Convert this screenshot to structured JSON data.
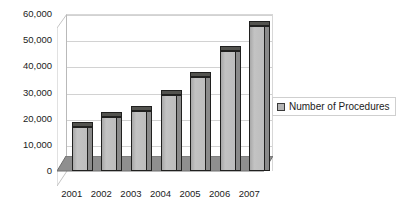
{
  "chart_data": {
    "type": "bar",
    "title": "",
    "xlabel": "",
    "ylabel": "",
    "categories": [
      "2001",
      "2002",
      "2003",
      "2004",
      "2005",
      "2006",
      "2007"
    ],
    "series": [
      {
        "name": "Number of Procedures",
        "values": [
          17000,
          20500,
          23000,
          29000,
          36000,
          46000,
          55500
        ]
      }
    ],
    "ylim": [
      0,
      60000
    ],
    "ytick_values": [
      0,
      10000,
      20000,
      30000,
      40000,
      50000,
      60000
    ],
    "ytick_labels": [
      "0",
      "10,000",
      "20,000",
      "30,000",
      "40,000",
      "50,000",
      "60,000"
    ],
    "grid": true,
    "style": "3d-column",
    "legend": {
      "position": "right",
      "entries": [
        {
          "label": "Number of Procedures",
          "swatch_color": "#b4b4b4"
        }
      ]
    },
    "colors": {
      "bar_face": "#bdbdbd",
      "bar_side": "#8a8a8a",
      "bar_top": "#53534f",
      "bar_outline": "#20201f",
      "floor": "#8f8f8f",
      "gridline": "#d2d2d2",
      "background": "#ffffff",
      "text": "#1b1b1b"
    }
  }
}
